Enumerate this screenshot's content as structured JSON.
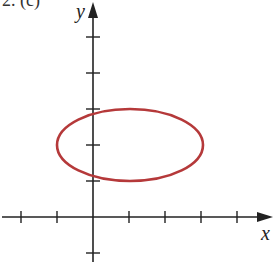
{
  "figure": {
    "part_label": "2. (c)",
    "x_axis_label": "x",
    "y_axis_label": "y",
    "tick_spacing_units": 1,
    "x_ticks": [
      -2,
      -1,
      1,
      2,
      3,
      4
    ],
    "y_ticks": [
      -1,
      1,
      2,
      3,
      4,
      5
    ],
    "ellipse": {
      "center": [
        1,
        2
      ],
      "semi_axis_x": 2,
      "semi_axis_y": 1,
      "stroke_color": "#b5393a"
    },
    "axis_color": "#222222"
  }
}
